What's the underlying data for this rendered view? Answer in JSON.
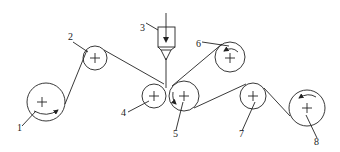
{
  "diagram": {
    "type": "roller web-path schematic",
    "colors": {
      "stroke": "#222222",
      "background": "#ffffff"
    },
    "rollers": [
      {
        "id": "1",
        "label": "1",
        "cx": 46,
        "cy": 102,
        "r": 19,
        "arrow": "counterclockwise-bottom"
      },
      {
        "id": "2",
        "label": "2",
        "cx": 95,
        "cy": 58,
        "r": 12
      },
      {
        "id": "4",
        "label": "4",
        "cx": 154,
        "cy": 96,
        "r": 12
      },
      {
        "id": "5",
        "label": "5",
        "cx": 184,
        "cy": 96,
        "r": 15,
        "arrow": "inside-lower-left"
      },
      {
        "id": "6",
        "label": "6",
        "cx": 230,
        "cy": 57,
        "r": 15,
        "arrow": "inside-upper"
      },
      {
        "id": "7",
        "label": "7",
        "cx": 253,
        "cy": 96,
        "r": 13
      },
      {
        "id": "8",
        "label": "8",
        "cx": 307,
        "cy": 108,
        "r": 18,
        "arrow": "inside-upper"
      }
    ],
    "hopper": {
      "label": "3"
    },
    "labels": [
      {
        "text": "1",
        "x": 17,
        "y": 131
      },
      {
        "text": "2",
        "x": 68,
        "y": 40
      },
      {
        "text": "3",
        "x": 140,
        "y": 31
      },
      {
        "text": "4",
        "x": 121,
        "y": 116
      },
      {
        "text": "5",
        "x": 173,
        "y": 137
      },
      {
        "text": "6",
        "x": 196,
        "y": 47
      },
      {
        "text": "7",
        "x": 239,
        "y": 137
      },
      {
        "text": "8",
        "x": 314,
        "y": 145
      }
    ]
  }
}
